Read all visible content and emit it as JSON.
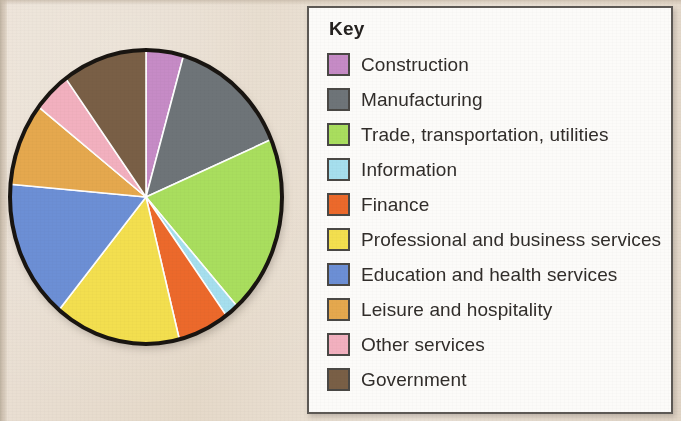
{
  "figure": {
    "legend_title": "Key"
  },
  "chart_data": {
    "type": "pie",
    "title": "",
    "subtitle": "",
    "xlabel": "",
    "ylabel": "",
    "legend_position": "right",
    "legend_title": "Key",
    "start_angle_deg": 0,
    "direction": "clockwise",
    "center": {
      "cx": 146,
      "cy": 175,
      "rx": 136,
      "ry": 147
    },
    "categories": [
      "Construction",
      "Manufacturing",
      "Trade, transportation, utilities",
      "Information",
      "Finance",
      "Professional and business services",
      "Education and health services",
      "Leisure and hospitality",
      "Other services",
      "Government"
    ],
    "values": [
      4.4,
      14.2,
      19.7,
      1.6,
      6.1,
      15.0,
      15.3,
      9.1,
      4.4,
      10.2
    ],
    "units": "percent",
    "slices": [
      {
        "label": "Construction",
        "value": 4.4,
        "color": "#c88bc8",
        "start_deg": 0.0,
        "end_deg": 16.0
      },
      {
        "label": "Manufacturing",
        "value": 14.2,
        "color": "#6e7478",
        "start_deg": 16.0,
        "end_deg": 67.0
      },
      {
        "label": "Trade, transportation, utilities",
        "value": 19.7,
        "color": "#a8e05a",
        "start_deg": 67.0,
        "end_deg": 138.0
      },
      {
        "label": "Information",
        "value": 1.6,
        "color": "#a5e0f0",
        "start_deg": 138.0,
        "end_deg": 143.8
      },
      {
        "label": "Finance",
        "value": 6.1,
        "color": "#f06828",
        "start_deg": 143.8,
        "end_deg": 165.8
      },
      {
        "label": "Professional and business services",
        "value": 15.0,
        "color": "#f5e04a",
        "start_deg": 165.8,
        "end_deg": 219.8
      },
      {
        "label": "Education and health services",
        "value": 15.3,
        "color": "#6b8fd8",
        "start_deg": 219.8,
        "end_deg": 275.0
      },
      {
        "label": "Leisure and hospitality",
        "value": 9.1,
        "color": "#e8a84a",
        "start_deg": 275.0,
        "end_deg": 307.8
      },
      {
        "label": "Other services",
        "value": 4.4,
        "color": "#f5b0c0",
        "start_deg": 307.8,
        "end_deg": 323.8
      },
      {
        "label": "Government",
        "value": 10.2,
        "color": "#7a5f45",
        "start_deg": 323.8,
        "end_deg": 360.0
      }
    ]
  },
  "legend": {
    "items": [
      {
        "label": "Construction",
        "color": "#c88bc8"
      },
      {
        "label": "Manufacturing",
        "color": "#6e7478"
      },
      {
        "label": "Trade, transportation, utilities",
        "color": "#a8e05a"
      },
      {
        "label": "Information",
        "color": "#a5e0f0"
      },
      {
        "label": "Finance",
        "color": "#f06828"
      },
      {
        "label": "Professional and business services",
        "color": "#f5e04a"
      },
      {
        "label": "Education and health services",
        "color": "#6b8fd8"
      },
      {
        "label": "Leisure and hospitality",
        "color": "#e8a84a"
      },
      {
        "label": "Other services",
        "color": "#f5b0c0"
      },
      {
        "label": "Government",
        "color": "#7a5f45"
      }
    ]
  },
  "colors": {
    "page_background": "#e8ddd0",
    "legend_background": "#fdfcfa",
    "legend_border": "#5d5954",
    "pie_outline": "#181410",
    "slice_divider": "#ffffff",
    "text": "#302c29"
  }
}
